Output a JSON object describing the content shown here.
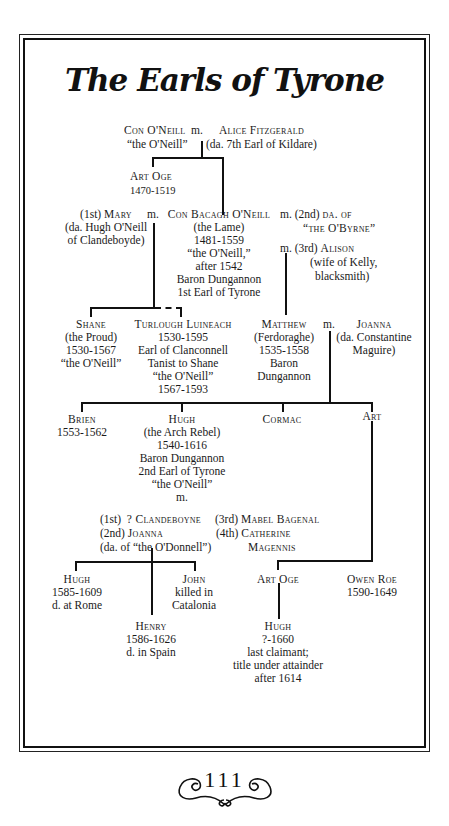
{
  "page": {
    "title": "The Earls of Tyrone",
    "page_number": "111"
  },
  "tree": {
    "con": {
      "name": "Con O'Neill",
      "line2": "“the O'Neill”"
    },
    "m_con": "m.",
    "alice": {
      "name": "Alice Fitzgerald",
      "line2": "(da. 7th Earl of Kildare)"
    },
    "art_oge_1": {
      "name": "Art Oge",
      "dates": "1470-1519"
    },
    "mary": {
      "prefix": "(1st)",
      "name": "Mary",
      "line2": "(da. Hugh O'Neill",
      "line3": "of Clandeboyde)"
    },
    "m_mary": "m.",
    "con_bacagh": {
      "name": "Con Bacagh O'Neill",
      "lines": [
        "(the Lame)",
        "1481-1559",
        "“the O'Neill,”",
        "after 1542",
        "Baron Dungannon",
        "1st Earl of Tyrone"
      ]
    },
    "obyrne": {
      "prefix": "m. (2nd)",
      "name": "da. of",
      "line2": "“the O'Byrne”"
    },
    "alison": {
      "prefix": "m. (3rd)",
      "name": "Alison",
      "line2": "(wife of Kelly,",
      "line3": "blacksmith)"
    },
    "shane": {
      "name": "Shane",
      "lines": [
        "(the Proud)",
        "1530-1567",
        "“the O'Neill”"
      ]
    },
    "turlough": {
      "name": "Turlough Luineach",
      "lines": [
        "1530-1595",
        "Earl of Clanconnell",
        "Tanist to Shane",
        "“the O'Neill”",
        "1567-1593"
      ]
    },
    "matthew": {
      "name": "Matthew",
      "lines": [
        "(Ferdoraghe)",
        "1535-1558",
        "Baron",
        "Dungannon"
      ]
    },
    "m_matthew": "m.",
    "joanna_m": {
      "name": "Joanna",
      "lines": [
        "(da. Constantine",
        "Maguire)"
      ]
    },
    "brien": {
      "name": "Brien",
      "dates": "1553-1562"
    },
    "hugh_rebel": {
      "name": "Hugh",
      "lines": [
        "(the Arch Rebel)",
        "1540-1616",
        "Baron Dungannon",
        "2nd Earl of Tyrone",
        "“the O'Neill”",
        "m."
      ]
    },
    "cormac": {
      "name": "Cormac"
    },
    "art": {
      "name": "Art"
    },
    "wives_hugh": {
      "w1": {
        "prefix": "(1st)",
        "name": "? Clandeboyne"
      },
      "w2": {
        "prefix": "(2nd)",
        "name": "Joanna",
        "line2": "(da. of “the O'Donnell”)"
      },
      "w3": {
        "prefix": "(3rd)",
        "name": "Mabel Bagenal"
      },
      "w4": {
        "prefix": "(4th)",
        "name": "Catherine",
        "line2": "Magennis"
      }
    },
    "hugh_rome": {
      "name": "Hugh",
      "lines": [
        "1585-1609",
        "d. at Rome"
      ]
    },
    "john": {
      "name": "John",
      "lines": [
        "killed in",
        "Catalonia"
      ]
    },
    "henry": {
      "name": "Henry",
      "lines": [
        "1586-1626",
        "d. in Spain"
      ]
    },
    "art_oge_2": {
      "name": "Art Oge"
    },
    "owen_roe": {
      "name": "Owen Roe",
      "dates": "1590-1649"
    },
    "hugh_last": {
      "name": "Hugh",
      "lines": [
        "?-1660",
        "last claimant;",
        "title under attainder",
        "after 1614"
      ]
    }
  }
}
